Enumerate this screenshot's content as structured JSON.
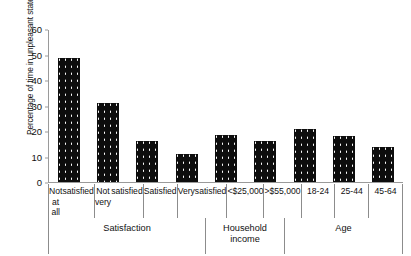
{
  "chart_data": {
    "type": "bar",
    "title": "",
    "xlabel": "",
    "ylabel": "Percentage of time in unpleasant state",
    "ylim": [
      0,
      60
    ],
    "yticks": [
      0,
      10,
      20,
      30,
      40,
      50,
      60
    ],
    "grid": false,
    "legend": "none",
    "categories": [
      "Not at all satisfied",
      "Not very satisfied",
      "Satisfied",
      "Very satisfied",
      "< $25,000",
      "> $55,000",
      "18-24",
      "25-44",
      "45-64"
    ],
    "category_lines": [
      [
        "Not at all",
        "satisfied"
      ],
      [
        "Not very",
        "satisfied"
      ],
      [
        "Satisfied"
      ],
      [
        "Very",
        "satisfied"
      ],
      [
        "<",
        "$25,000"
      ],
      [
        ">",
        "$55,000"
      ],
      [
        "18-24"
      ],
      [
        "25-44"
      ],
      [
        "45-64"
      ]
    ],
    "values": [
      49,
      31,
      16,
      11,
      18.5,
      16,
      21,
      18,
      14
    ],
    "groups": [
      {
        "label": "Satisfaction",
        "span": 4
      },
      {
        "label": "Household income",
        "span": 2
      },
      {
        "label": "Age",
        "span": 3
      }
    ],
    "group_label_lines": [
      [
        "Satisfaction"
      ],
      [
        "Household",
        "income"
      ],
      [
        "Age"
      ]
    ],
    "bar_color": "#0d0d0d",
    "axis_color": "#9a9a9a"
  }
}
